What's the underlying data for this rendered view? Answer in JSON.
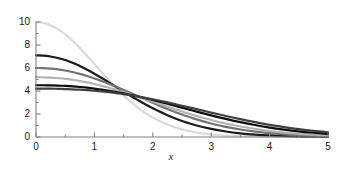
{
  "chart_data": {
    "type": "line",
    "title": "",
    "subtitle": "",
    "xlabel": "x",
    "ylabel": "",
    "xlim": [
      0,
      5
    ],
    "ylim": [
      0,
      10
    ],
    "xticks": [
      0,
      1,
      2,
      3,
      4,
      5
    ],
    "xticklabels": [
      "0",
      "1",
      "2",
      "3",
      "4",
      "5"
    ],
    "yticks": [
      0,
      2,
      4,
      6,
      8,
      10
    ],
    "yticklabels": [
      "0",
      "2",
      "4",
      "6",
      "8",
      "10"
    ],
    "xminorstep": 0.5,
    "yminorstep": 1,
    "grid": false,
    "legend": false,
    "legend_position": "none",
    "axis_color": "#808080",
    "tick_label_color": "#1a1a1a",
    "background": "#ffffff",
    "series": [
      {
        "name": "curve-1",
        "color": "#d9d9d9",
        "width": 2.2,
        "x": [
          0,
          0.125,
          0.25,
          0.375,
          0.5,
          0.625,
          0.75,
          0.875,
          1,
          1.125,
          1.25,
          1.375,
          1.5,
          1.625,
          1.75,
          1.875,
          2,
          2.25,
          2.5,
          2.75,
          3,
          3.25,
          3.5,
          3.75,
          4,
          4.25,
          4.5,
          4.75,
          5
        ],
        "y": [
          10.0,
          9.93,
          9.72,
          9.38,
          8.92,
          8.37,
          7.74,
          7.06,
          6.35,
          5.63,
          4.92,
          4.25,
          3.62,
          3.04,
          2.53,
          2.08,
          1.69,
          1.08,
          0.66,
          0.39,
          0.22,
          0.12,
          0.063,
          0.032,
          0.016,
          0.008,
          0.004,
          0.002,
          0.001
        ]
      },
      {
        "name": "curve-2",
        "color": "#1a1a1a",
        "width": 2.2,
        "x": [
          0,
          0.125,
          0.25,
          0.375,
          0.5,
          0.625,
          0.75,
          0.875,
          1,
          1.125,
          1.25,
          1.375,
          1.5,
          1.625,
          1.75,
          1.875,
          2,
          2.25,
          2.5,
          2.75,
          3,
          3.25,
          3.5,
          3.75,
          4,
          4.25,
          4.5,
          4.75,
          5
        ],
        "y": [
          7.1,
          7.08,
          7.0,
          6.87,
          6.69,
          6.45,
          6.17,
          5.85,
          5.5,
          5.13,
          4.74,
          4.35,
          3.96,
          3.57,
          3.2,
          2.84,
          2.5,
          1.89,
          1.39,
          1.0,
          0.7,
          0.48,
          0.32,
          0.21,
          0.135,
          0.085,
          0.053,
          0.032,
          0.019
        ]
      },
      {
        "name": "curve-3",
        "color": "#737373",
        "width": 2.2,
        "x": [
          0,
          0.125,
          0.25,
          0.375,
          0.5,
          0.625,
          0.75,
          0.875,
          1,
          1.125,
          1.25,
          1.375,
          1.5,
          1.625,
          1.75,
          1.875,
          2,
          2.25,
          2.5,
          2.75,
          3,
          3.25,
          3.5,
          3.75,
          4,
          4.25,
          4.5,
          4.75,
          5
        ],
        "y": [
          6.0,
          5.99,
          5.95,
          5.88,
          5.78,
          5.65,
          5.49,
          5.3,
          5.09,
          4.86,
          4.62,
          4.36,
          4.09,
          3.82,
          3.54,
          3.26,
          2.98,
          2.44,
          1.95,
          1.53,
          1.17,
          0.88,
          0.65,
          0.47,
          0.33,
          0.23,
          0.16,
          0.11,
          0.072
        ]
      },
      {
        "name": "curve-4",
        "color": "#b3b3b3",
        "width": 2.2,
        "x": [
          0,
          0.125,
          0.25,
          0.375,
          0.5,
          0.625,
          0.75,
          0.875,
          1,
          1.125,
          1.25,
          1.375,
          1.5,
          1.625,
          1.75,
          1.875,
          2,
          2.25,
          2.5,
          2.75,
          3,
          3.25,
          3.5,
          3.75,
          4,
          4.25,
          4.5,
          4.75,
          5
        ],
        "y": [
          5.2,
          5.19,
          5.17,
          5.12,
          5.06,
          4.97,
          4.87,
          4.75,
          4.61,
          4.45,
          4.28,
          4.1,
          3.91,
          3.71,
          3.5,
          3.29,
          3.08,
          2.64,
          2.22,
          1.83,
          1.48,
          1.17,
          0.91,
          0.7,
          0.52,
          0.39,
          0.28,
          0.2,
          0.14
        ]
      },
      {
        "name": "curve-5",
        "color": "#0d0d0d",
        "width": 2.2,
        "x": [
          0,
          0.125,
          0.25,
          0.375,
          0.5,
          0.625,
          0.75,
          0.875,
          1,
          1.125,
          1.25,
          1.375,
          1.5,
          1.625,
          1.75,
          1.875,
          2,
          2.25,
          2.5,
          2.75,
          3,
          3.25,
          3.5,
          3.75,
          4,
          4.25,
          4.5,
          4.75,
          5
        ],
        "y": [
          4.5,
          4.5,
          4.49,
          4.47,
          4.44,
          4.4,
          4.35,
          4.29,
          4.21,
          4.12,
          4.02,
          3.91,
          3.79,
          3.66,
          3.52,
          3.37,
          3.22,
          2.89,
          2.55,
          2.21,
          1.88,
          1.57,
          1.29,
          1.04,
          0.82,
          0.64,
          0.49,
          0.37,
          0.27
        ]
      },
      {
        "name": "curve-6",
        "color": "#404040",
        "width": 2.2,
        "x": [
          0,
          0.125,
          0.25,
          0.375,
          0.5,
          0.625,
          0.75,
          0.875,
          1,
          1.125,
          1.25,
          1.375,
          1.5,
          1.625,
          1.75,
          1.875,
          2,
          2.25,
          2.5,
          2.75,
          3,
          3.25,
          3.5,
          3.75,
          4,
          4.25,
          4.5,
          4.75,
          5
        ],
        "y": [
          4.2,
          4.2,
          4.2,
          4.19,
          4.17,
          4.15,
          4.12,
          4.08,
          4.03,
          3.97,
          3.9,
          3.82,
          3.73,
          3.63,
          3.52,
          3.4,
          3.28,
          3.01,
          2.72,
          2.42,
          2.12,
          1.83,
          1.55,
          1.29,
          1.06,
          0.86,
          0.68,
          0.53,
          0.41
        ]
      }
    ]
  }
}
